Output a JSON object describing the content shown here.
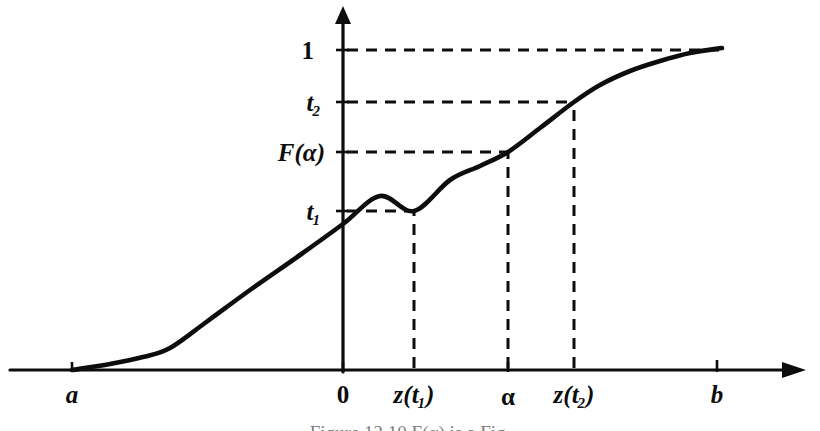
{
  "figure": {
    "background_color": "#ffffff",
    "ink_color": "#0d0d0d",
    "caption": "Figure 12.10    F(α) is a Fig.",
    "x_axis": {
      "name": "horizontal-axis",
      "ticks": [
        {
          "id": "a",
          "label": "a",
          "sub": "",
          "x": 72,
          "dashed_guide": false
        },
        {
          "id": "zero",
          "label": "0",
          "sub": "",
          "x": 343,
          "dashed_guide": false
        },
        {
          "id": "zt1",
          "label": "z(t",
          "sub": "1",
          "x": 414,
          "dashed_guide": true
        },
        {
          "id": "alpha",
          "label": "α",
          "sub": "",
          "x": 508,
          "dashed_guide": true
        },
        {
          "id": "zt2",
          "label": "z(t",
          "sub": "2",
          "x": 574,
          "dashed_guide": true
        },
        {
          "id": "b",
          "label": "b",
          "sub": "",
          "x": 717,
          "dashed_guide": false
        }
      ]
    },
    "y_axis": {
      "name": "vertical-axis",
      "ticks": [
        {
          "id": "one",
          "label": "1",
          "sub": "",
          "y": 50,
          "dashed_guide": true
        },
        {
          "id": "t2",
          "label": "t",
          "sub": "2",
          "y": 102,
          "dashed_guide": true
        },
        {
          "id": "Falpha",
          "label": "F(α)",
          "sub": "",
          "y": 152,
          "dashed_guide": true
        },
        {
          "id": "t1",
          "label": "t",
          "sub": "1",
          "y": 211,
          "dashed_guide": true
        }
      ]
    },
    "marked_points": [
      {
        "id": "p1",
        "x": 414,
        "y": 211,
        "x_label": "z(t1)",
        "y_label": "t1"
      },
      {
        "id": "p2",
        "x": 508,
        "y": 152,
        "x_label": "alpha",
        "y_label": "F(alpha)"
      },
      {
        "id": "p3",
        "x": 574,
        "y": 102,
        "x_label": "z(t2)",
        "y_label": "t2"
      }
    ]
  },
  "chart_data": {
    "type": "line",
    "xlabel": "",
    "ylabel": "",
    "grid": false,
    "legend": null,
    "xlim": [
      10,
      790
    ],
    "ylim": [
      370,
      8
    ],
    "axis_origin_px": {
      "x": 343,
      "y": 370
    },
    "x_tick_labels": [
      "a",
      "0",
      "z(t1)",
      "α",
      "z(t2)",
      "b"
    ],
    "x_tick_px": [
      72,
      343,
      414,
      508,
      574,
      717
    ],
    "y_tick_labels": [
      "t1",
      "F(α)",
      "t2",
      "1"
    ],
    "y_tick_px": [
      211,
      152,
      102,
      50
    ],
    "series": [
      {
        "name": "F",
        "points_px": [
          [
            72,
            370
          ],
          [
            110,
            364
          ],
          [
            143,
            357
          ],
          [
            170,
            348
          ],
          [
            205,
            323
          ],
          [
            250,
            290
          ],
          [
            300,
            255
          ],
          [
            343,
            224
          ],
          [
            380,
            196
          ],
          [
            414,
            211
          ],
          [
            450,
            180
          ],
          [
            480,
            166
          ],
          [
            508,
            152
          ],
          [
            540,
            128
          ],
          [
            574,
            102
          ],
          [
            600,
            85
          ],
          [
            630,
            71
          ],
          [
            660,
            61
          ],
          [
            690,
            53
          ],
          [
            722,
            48
          ]
        ]
      }
    ],
    "annotations": [
      {
        "text": "1",
        "at_px": [
          322,
          50
        ],
        "anchor": "end"
      },
      {
        "text": "t₂",
        "at_px": [
          322,
          102
        ],
        "anchor": "end"
      },
      {
        "text": "F(α)",
        "at_px": [
          322,
          152
        ],
        "anchor": "end"
      },
      {
        "text": "t₁",
        "at_px": [
          322,
          211
        ],
        "anchor": "end"
      },
      {
        "text": "a",
        "at_px": [
          72,
          398
        ],
        "anchor": "middle"
      },
      {
        "text": "0",
        "at_px": [
          343,
          398
        ],
        "anchor": "middle"
      },
      {
        "text": "z(t₁)",
        "at_px": [
          414,
          398
        ],
        "anchor": "middle"
      },
      {
        "text": "α",
        "at_px": [
          508,
          398
        ],
        "anchor": "middle"
      },
      {
        "text": "z(t₂)",
        "at_px": [
          574,
          398
        ],
        "anchor": "middle"
      },
      {
        "text": "b",
        "at_px": [
          717,
          398
        ],
        "anchor": "middle"
      }
    ]
  }
}
